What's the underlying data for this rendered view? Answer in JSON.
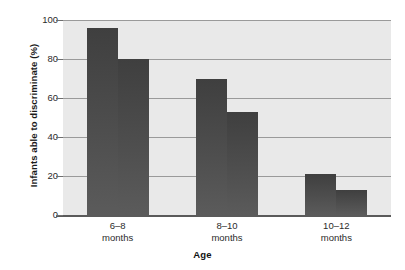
{
  "chart_data": {
    "type": "bar",
    "title": "",
    "xlabel": "Age",
    "ylabel": "Infants able to discriminate (%)",
    "categories": [
      "6–18 months",
      "8–10 months",
      "10–12 months"
    ],
    "category_lines": [
      [
        "6–8",
        "months"
      ],
      [
        "8–10",
        "months"
      ],
      [
        "10–12",
        "months"
      ]
    ],
    "series": [
      {
        "name": "bar-a",
        "values": [
          96,
          70,
          21
        ]
      },
      {
        "name": "bar-b",
        "values": [
          80,
          53,
          13
        ]
      }
    ],
    "ylim": [
      0,
      100
    ],
    "yticks": [
      0,
      20,
      40,
      60,
      80,
      100
    ],
    "ytick_labels": [
      "0",
      "20",
      "40",
      "60",
      "80",
      "100"
    ],
    "grid": true,
    "gridlines_at": [
      20,
      40,
      60,
      80,
      100
    ],
    "legend": "none",
    "bar_color": "#4a4a4a",
    "plot_background": "#e9e9e9",
    "gridline_color": "#9a9a9a",
    "axis_color": "#5a5a5a"
  }
}
